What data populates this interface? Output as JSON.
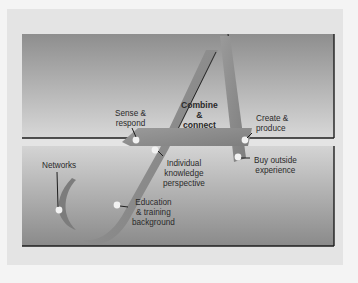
{
  "diagram": {
    "title": "",
    "shape": "stylized letter A formed by a J-shaped stroke and crossbar",
    "labels": {
      "combine": [
        "Combine",
        "&",
        "connect"
      ],
      "sense": [
        "Sense &",
        "respond"
      ],
      "create": [
        "Create &",
        "produce"
      ],
      "individual": [
        "Individual",
        "knowledge",
        "perspective"
      ],
      "buy": [
        "Buy outside",
        "experience"
      ],
      "networks": [
        "Networks"
      ],
      "education": [
        "Education",
        "& training",
        "background"
      ]
    },
    "colors": {
      "background": "#f4f4f4",
      "frame": "#e4e4e4",
      "panel_dark": "#8c8c8c",
      "panel_light": "#d6d6d6",
      "letter_fill": "#8a8a8a",
      "outline": "#1e1e1e",
      "node": "#f2f2f2"
    }
  }
}
